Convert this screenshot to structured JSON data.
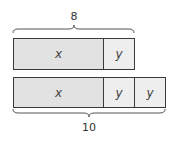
{
  "diagram": {
    "type": "tape-diagram",
    "top_total": "8",
    "bottom_total": "10",
    "top_bar": [
      {
        "label": "x",
        "kind": "x"
      },
      {
        "label": "y",
        "kind": "y"
      }
    ],
    "bottom_bar": [
      {
        "label": "x",
        "kind": "x"
      },
      {
        "label": "y",
        "kind": "y"
      },
      {
        "label": "y",
        "kind": "y"
      }
    ],
    "colors": {
      "x_fill": "#e2e2e2",
      "y_fill": "#eeeeee",
      "border": "#3a3a3a"
    }
  }
}
